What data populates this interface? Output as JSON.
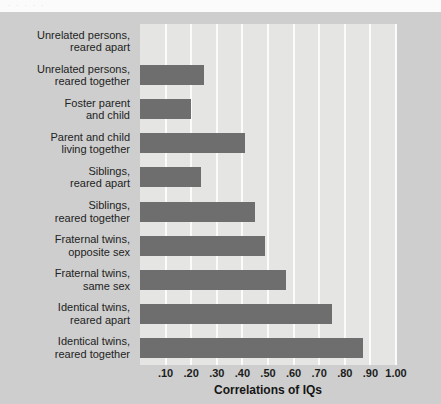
{
  "figure": {
    "top_clip_text": "· · · · ·",
    "panel_background": "#cdcecd",
    "plot_background": "#e5e5e3",
    "bar_color": "#6e6e6e",
    "gridline_color": "#fbfbfb"
  },
  "chart_data": {
    "type": "bar",
    "orientation": "horizontal",
    "title": "",
    "xlabel": "Correlations of IQs",
    "ylabel": "",
    "xlim": [
      0,
      1.0
    ],
    "grid": true,
    "legend": "none",
    "xticks": [
      0.1,
      0.2,
      0.3,
      0.4,
      0.5,
      0.6,
      0.7,
      0.8,
      0.9,
      1.0
    ],
    "xtick_labels": [
      ".10",
      ".20",
      ".30",
      ".40",
      ".50",
      ".60",
      ".70",
      ".80",
      ".90",
      "1.00"
    ],
    "categories": [
      "Unrelated persons,\nreared apart",
      "Unrelated persons,\nreared together",
      "Foster parent\nand child",
      "Parent and child\nliving together",
      "Siblings,\nreared apart",
      "Siblings,\nreared together",
      "Fraternal twins,\nopposite sex",
      "Fraternal twins,\nsame sex",
      "Identical twins,\nreared apart",
      "Identical twins,\nreared together"
    ],
    "values": [
      0.0,
      0.25,
      0.2,
      0.41,
      0.24,
      0.45,
      0.49,
      0.57,
      0.75,
      0.87
    ]
  }
}
